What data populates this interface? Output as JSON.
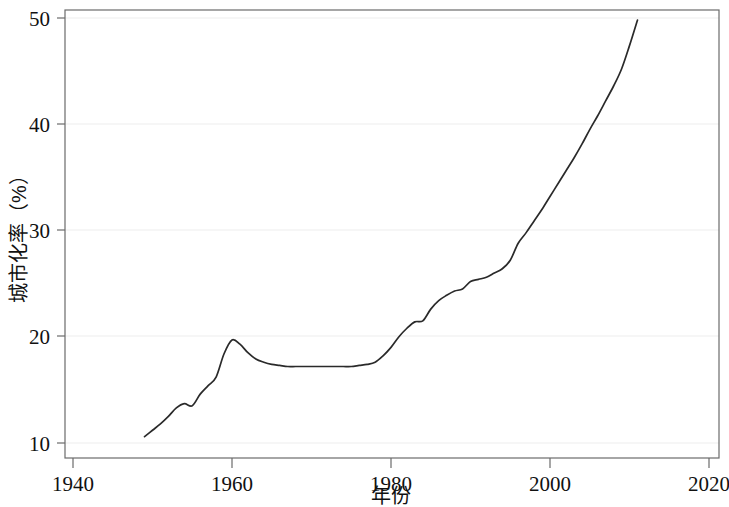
{
  "chart_data": {
    "type": "line",
    "title": "",
    "subtitle": "",
    "xlabel": "年份",
    "ylabel": "城市化率（%）",
    "xlim": [
      1940,
      2020
    ],
    "ylim": [
      10,
      50
    ],
    "xticks": [
      1940,
      1960,
      1980,
      2000,
      2020
    ],
    "yticks": [
      10,
      20,
      30,
      40,
      50
    ],
    "xtick_labels": [
      "1940",
      "1960",
      "1980",
      "2000",
      "2020"
    ],
    "ytick_labels": [
      "10",
      "20",
      "30",
      "40",
      "50"
    ],
    "grid": "horizontal",
    "legend": "none",
    "line_color": "#2a2a2a",
    "frame_color": "#6b6b6b",
    "grid_color": "#ededed",
    "background_color": "#ffffff",
    "series": [
      {
        "name": "城市化率",
        "x": [
          1949,
          1950,
          1951,
          1952,
          1953,
          1954,
          1955,
          1956,
          1957,
          1958,
          1959,
          1960,
          1961,
          1962,
          1963,
          1964,
          1965,
          1966,
          1967,
          1968,
          1969,
          1970,
          1971,
          1972,
          1973,
          1974,
          1975,
          1976,
          1977,
          1978,
          1979,
          1980,
          1981,
          1982,
          1983,
          1984,
          1985,
          1986,
          1987,
          1988,
          1989,
          1990,
          1991,
          1992,
          1993,
          1994,
          1995,
          1996,
          1997,
          1998,
          1999,
          2000,
          2001,
          2002,
          2003,
          2004,
          2005,
          2006,
          2007,
          2008,
          2009,
          2010,
          2011
        ],
        "values": [
          10.6,
          11.2,
          11.8,
          12.5,
          13.3,
          13.7,
          13.5,
          14.6,
          15.4,
          16.2,
          18.4,
          19.7,
          19.3,
          18.5,
          17.9,
          17.6,
          17.4,
          17.3,
          17.2,
          17.2,
          17.2,
          17.2,
          17.2,
          17.2,
          17.2,
          17.2,
          17.2,
          17.3,
          17.4,
          17.6,
          18.2,
          19.0,
          20.0,
          20.8,
          21.4,
          21.5,
          22.6,
          23.4,
          23.9,
          24.3,
          24.5,
          25.2,
          25.4,
          25.6,
          26.0,
          26.4,
          27.2,
          28.8,
          29.8,
          30.9,
          32.0,
          33.2,
          34.4,
          35.6,
          36.8,
          38.1,
          39.5,
          40.8,
          42.2,
          43.6,
          45.2,
          47.4,
          49.8
        ]
      }
    ],
    "annotations": []
  },
  "axes": {
    "y_axis_title": "城市化率（%）",
    "x_axis_title": "年份"
  }
}
